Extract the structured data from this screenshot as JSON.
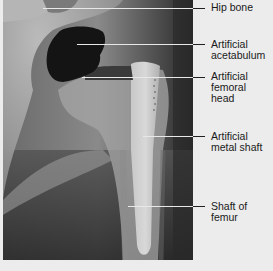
{
  "figure": {
    "labels": [
      {
        "id": "hip-bone",
        "text": "Hip bone",
        "line_y": 8,
        "line_x_start": 43,
        "text_top": 2
      },
      {
        "id": "artificial-acetabulum",
        "text": "Artificial\nacetabulum",
        "line_y": 44,
        "line_x_start": 77,
        "text_top": 39
      },
      {
        "id": "artificial-femoral-head",
        "text": "Artificial\nfemoral\nhead",
        "line_y": 77,
        "line_x_start": 82,
        "text_top": 71
      },
      {
        "id": "artificial-metal-shaft",
        "text": "Artificial\nmetal shaft",
        "line_y": 136,
        "line_x_start": 143,
        "text_top": 131
      },
      {
        "id": "shaft-of-femur",
        "text": "Shaft of\nfemur",
        "line_y": 206,
        "line_x_start": 128,
        "text_top": 201
      }
    ]
  }
}
